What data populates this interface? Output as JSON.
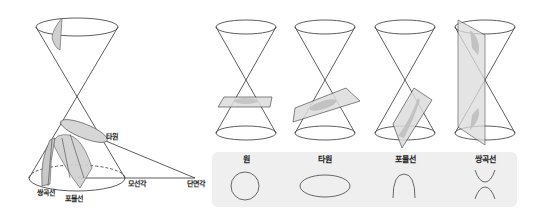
{
  "diagram": {
    "left_figure": {
      "labels": {
        "ellipse": "타원",
        "hyperbola": "쌍곡선",
        "parabola": "포물선",
        "generatrix_angle": "모선각",
        "section_angle": "단면각"
      }
    },
    "cones": [
      {
        "name": "circle-section",
        "plane": "horizontal"
      },
      {
        "name": "ellipse-section",
        "plane": "tilted"
      },
      {
        "name": "parabola-section",
        "plane": "parallel-to-generatrix"
      },
      {
        "name": "hyperbola-section",
        "plane": "vertical"
      }
    ],
    "legend_panel": {
      "items": [
        {
          "label": "원",
          "shape": "circle"
        },
        {
          "label": "타원",
          "shape": "ellipse"
        },
        {
          "label": "포물선",
          "shape": "parabola"
        },
        {
          "label": "쌍곡선",
          "shape": "hyperbola"
        }
      ]
    },
    "colors": {
      "line": "#333333",
      "fill": "#d4d4d4",
      "panel": "#efefef"
    }
  }
}
